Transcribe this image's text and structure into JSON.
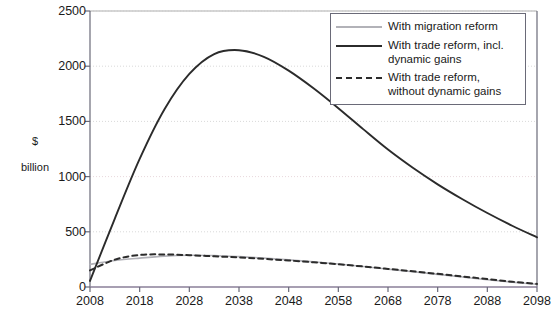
{
  "chart_data": {
    "type": "line",
    "title": "",
    "xlabel": "",
    "ylabel": "$\nbillion",
    "ylabel_line1": "$",
    "ylabel_line2": "billion",
    "xlim": [
      2008,
      2098
    ],
    "ylim": [
      0,
      2500
    ],
    "grid": true,
    "grid_axis": "y",
    "legend_position": "top-right",
    "x": [
      2008,
      2013,
      2018,
      2023,
      2028,
      2033,
      2038,
      2043,
      2048,
      2053,
      2058,
      2063,
      2068,
      2073,
      2078,
      2083,
      2088,
      2093,
      2098
    ],
    "xticks": [
      2008,
      2018,
      2028,
      2038,
      2048,
      2058,
      2068,
      2078,
      2088,
      2098
    ],
    "yticks": [
      0,
      500,
      1000,
      1500,
      2000,
      2500
    ],
    "series": [
      {
        "name": "With migration reform",
        "style": "solid",
        "color": "#b2b2b8",
        "values": [
          205,
          240,
          262,
          280,
          288,
          285,
          275,
          262,
          246,
          228,
          208,
          186,
          162,
          138,
          114,
          90,
          66,
          44,
          25
        ]
      },
      {
        "name": "With trade reform, incl. dynamic gains",
        "style": "solid",
        "color": "#2b2b2b",
        "values": [
          55,
          620,
          1160,
          1610,
          1930,
          2110,
          2145,
          2085,
          1960,
          1800,
          1620,
          1430,
          1245,
          1080,
          930,
          795,
          670,
          555,
          450
        ]
      },
      {
        "name": "With trade reform, without dynamic gains",
        "style": "dashed",
        "color": "#2b2b2b",
        "values": [
          150,
          248,
          290,
          295,
          288,
          278,
          268,
          255,
          240,
          224,
          206,
          186,
          164,
          142,
          119,
          95,
          72,
          48,
          28
        ]
      }
    ]
  },
  "legend": {
    "entries": [
      {
        "label": "With migration reform",
        "icon": "line-solid-light-icon"
      },
      {
        "label": "With trade reform, incl. dynamic gains",
        "icon": "line-solid-dark-icon"
      },
      {
        "label": "With trade reform, without dynamic gains",
        "icon": "line-dashed-dark-icon"
      }
    ]
  },
  "colors": {
    "axis": "#6a6a78",
    "baseline": "#8a7f98",
    "grid": "#d9d9d9",
    "grid_highlight": "#e8d8dc",
    "text": "#1a1a1a",
    "series_light": "#b2b2b8",
    "series_dark": "#2b2b2b"
  }
}
